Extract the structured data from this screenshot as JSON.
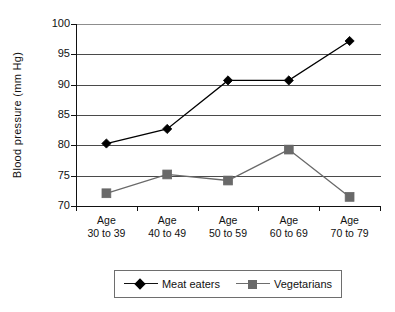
{
  "chart_data": {
    "type": "line",
    "title": "",
    "subtitle": "",
    "xlabel": "",
    "ylabel": "Blood  pressure  (mm Hg)",
    "ylim": [
      70,
      100
    ],
    "ytick_step": 5,
    "yticks": [
      70,
      75,
      80,
      85,
      90,
      95,
      100
    ],
    "ytick_labels": [
      "70",
      "75",
      "80",
      "85",
      "90",
      "95",
      "100"
    ],
    "grid": true,
    "legend_position": "bottom",
    "categories": [
      "Age\n30 to 39",
      "Age\n40 to 49",
      "Age\n50 to 59",
      "Age\n60 to 69",
      "Age\n70 to 79"
    ],
    "categories_line1": [
      "Age",
      "Age",
      "Age",
      "Age",
      "Age"
    ],
    "categories_line2": [
      "30 to 39",
      "40 to 49",
      "50 to 59",
      "60 to 69",
      "70 to 79"
    ],
    "series": [
      {
        "name": "Meat eaters",
        "marker": "diamond",
        "color": "#000000",
        "values": [
          80.3,
          82.7,
          90.7,
          90.7,
          97.2
        ]
      },
      {
        "name": "Vegetarians",
        "marker": "square",
        "color": "#696969",
        "values": [
          72.1,
          75.2,
          74.2,
          79.3,
          71.5
        ]
      }
    ]
  },
  "legend": {
    "entries": [
      {
        "label": "Meat eaters"
      },
      {
        "label": "Vegetarians"
      }
    ]
  },
  "colors": {
    "axis": "#111111",
    "gridline": "#4a4a4a",
    "meat_eaters": "#000000",
    "vegetarians": "#696969",
    "background": "#ffffff"
  }
}
